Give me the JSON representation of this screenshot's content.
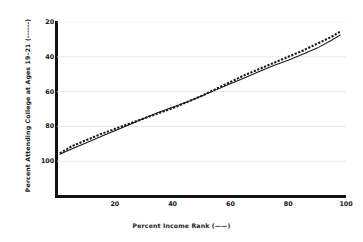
{
  "chart_data": {
    "type": "line",
    "title": "",
    "subtitle": "",
    "xlabel": "Percent Income Rank (——)",
    "ylabel": "Percent Attending College at Ages 19–21 (------)",
    "xlim": [
      0,
      100
    ],
    "ylim": [
      0,
      100
    ],
    "xticks": [
      20,
      40,
      60,
      80,
      100
    ],
    "yticks": [
      20,
      40,
      60,
      80,
      100
    ],
    "grid": "horizontal",
    "legend_position": "in-axis-labels",
    "series": [
      {
        "name": "Percent Income Rank",
        "style": "solid",
        "color": "#1a1a1a",
        "x": [
          1,
          5,
          10,
          15,
          20,
          25,
          30,
          35,
          40,
          45,
          50,
          55,
          60,
          65,
          70,
          75,
          80,
          85,
          90,
          95,
          98
        ],
        "values": [
          24.0,
          27.0,
          30.5,
          34.0,
          37.5,
          41.0,
          44.5,
          48.0,
          51.0,
          54.0,
          57.5,
          61.0,
          64.5,
          68.0,
          71.5,
          75.0,
          78.0,
          81.5,
          85.0,
          89.5,
          92.5
        ]
      },
      {
        "name": "Percent Attending College at Ages 19-21",
        "style": "dashed",
        "color": "#1a1a1a",
        "x": [
          1,
          5,
          10,
          15,
          20,
          25,
          30,
          35,
          40,
          45,
          50,
          55,
          60,
          65,
          70,
          75,
          80,
          85,
          90,
          95,
          98
        ],
        "values": [
          24.5,
          28.5,
          32.0,
          35.5,
          38.5,
          41.5,
          44.5,
          47.5,
          50.5,
          54.0,
          57.5,
          61.5,
          65.5,
          69.5,
          73.0,
          76.5,
          80.0,
          83.5,
          87.5,
          91.5,
          94.5
        ]
      }
    ]
  },
  "axes": {
    "y_tick_labels": [
      "100",
      "80",
      "60",
      "40",
      "20"
    ],
    "x_tick_labels": [
      "20",
      "40",
      "60",
      "80",
      "100"
    ]
  },
  "colors": {
    "background": "#ffffff",
    "axis": "#111111",
    "gridline": "#e3e3e6",
    "series": "#1a1a1a",
    "text": "#141414"
  }
}
